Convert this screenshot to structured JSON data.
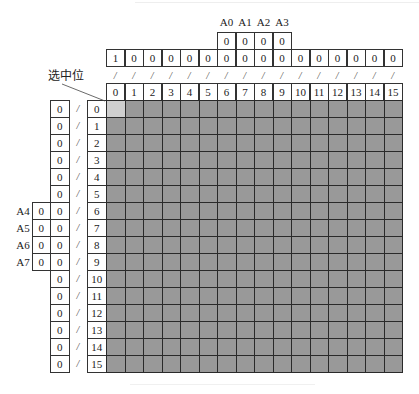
{
  "figure": {
    "top_address_labels": [
      "A0",
      "A1",
      "A2",
      "A3"
    ],
    "top_address_values": [
      "0",
      "0",
      "0",
      "0"
    ],
    "top_data_values": [
      "1",
      "0",
      "0",
      "0",
      "0",
      "0",
      "0",
      "0",
      "0",
      "0",
      "0",
      "0",
      "0",
      "0",
      "0",
      "0"
    ],
    "top_separator": "/",
    "column_indices": [
      "0",
      "1",
      "2",
      "3",
      "4",
      "5",
      "6",
      "7",
      "8",
      "9",
      "10",
      "11",
      "12",
      "13",
      "14",
      "15"
    ],
    "row_indices": [
      "0",
      "1",
      "2",
      "3",
      "4",
      "5",
      "6",
      "7",
      "8",
      "9",
      "10",
      "11",
      "12",
      "13",
      "14",
      "15"
    ],
    "left_data_values": [
      "0",
      "0",
      "0",
      "0",
      "0",
      "0",
      "0",
      "0",
      "0",
      "0",
      "0",
      "0",
      "0",
      "0",
      "0",
      "0"
    ],
    "left_separator": "/",
    "left_address_labels": [
      "A4",
      "A5",
      "A6",
      "A7"
    ],
    "left_address_values": [
      "0",
      "0",
      "0",
      "0"
    ],
    "left_address_rows": [
      6,
      7,
      8,
      9
    ],
    "selected_label": "选中位",
    "selected_cell": {
      "row": 0,
      "col": 0
    },
    "colors": {
      "grid_fill": "#999999",
      "selected_fill": "#cfcfcf",
      "border": "#2a2a2a"
    }
  }
}
